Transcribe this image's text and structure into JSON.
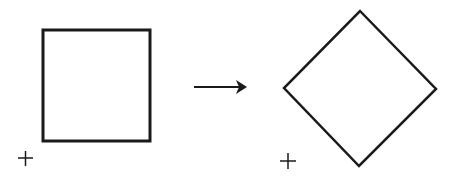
{
  "diagram": {
    "colors": {
      "stroke": "#1a1a1a",
      "background": "#ffffff"
    },
    "left_figure": {
      "shape": "square",
      "x": 43,
      "y": 30,
      "width": 107,
      "height": 111
    },
    "left_origin": {
      "symbol": "+",
      "x": 25,
      "y": 158
    },
    "arrow": {
      "x1": 194,
      "y1": 87,
      "x2": 247,
      "y2": 87
    },
    "right_figure": {
      "shape": "diamond",
      "points": "360,11 436,89 359,166 284,88"
    },
    "right_origin": {
      "symbol": "+",
      "x": 288,
      "y": 161
    }
  }
}
